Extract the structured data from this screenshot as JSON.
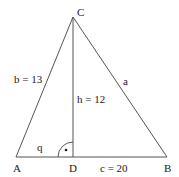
{
  "diagram": {
    "vertices": {
      "A": {
        "label": "A",
        "x": 16,
        "y": 157
      },
      "B": {
        "label": "B",
        "x": 167,
        "y": 157
      },
      "C": {
        "label": "C",
        "x": 73,
        "y": 17
      },
      "D": {
        "label": "D",
        "x": 73,
        "y": 157
      }
    },
    "labels": {
      "side_b": "b = 13",
      "side_a": "a",
      "height": "h = 12",
      "segment_q": "q",
      "side_c": "c = 20",
      "right_angle_dot": "·"
    },
    "colors": {
      "line": "#555555",
      "text": "#1a1a1a",
      "background": "#ffffff"
    }
  }
}
